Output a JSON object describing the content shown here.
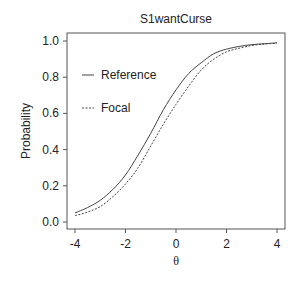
{
  "chart_data": {
    "type": "line",
    "title": "S1wantCurse",
    "xlabel": "θ",
    "ylabel": "Probability",
    "xlim": [
      -4,
      4
    ],
    "ylim": [
      0,
      1
    ],
    "xticks": [
      "-4",
      "-2",
      "0",
      "2",
      "4"
    ],
    "yticks": [
      "0.0",
      "0.2",
      "0.4",
      "0.6",
      "0.8",
      "1.0"
    ],
    "grid": false,
    "legend_position": "upper-left-inside",
    "x": [
      -4,
      -3.5,
      -3,
      -2.5,
      -2,
      -1.5,
      -1,
      -0.5,
      0,
      0.5,
      1,
      1.5,
      2,
      2.5,
      3,
      3.5,
      4
    ],
    "series": [
      {
        "name": "Reference",
        "style": "solid",
        "values": [
          0.05,
          0.08,
          0.12,
          0.18,
          0.26,
          0.37,
          0.49,
          0.62,
          0.73,
          0.82,
          0.88,
          0.93,
          0.955,
          0.97,
          0.98,
          0.985,
          0.99
        ]
      },
      {
        "name": "Focal",
        "style": "dashed",
        "values": [
          0.035,
          0.055,
          0.085,
          0.14,
          0.21,
          0.3,
          0.42,
          0.54,
          0.65,
          0.75,
          0.84,
          0.9,
          0.94,
          0.96,
          0.975,
          0.983,
          0.988
        ]
      }
    ]
  }
}
